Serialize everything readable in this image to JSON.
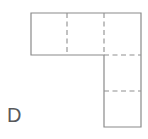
{
  "figure": {
    "label": "D",
    "shape_name": "l-shaped-net",
    "colors": {
      "outline": "#8a8a8a",
      "fold": "#8f8f8f",
      "fill": "#ffffff",
      "label": "#58595b",
      "background": "#ffffff"
    },
    "geometry": {
      "unit": 36,
      "outline_path": "M 31 13 L 141 13 L 141 127 L 104 127 L 104 55 L 31 55 Z",
      "fold_lines": [
        {
          "name": "fold-vertical-1",
          "x1": 67,
          "y1": 13,
          "x2": 67,
          "y2": 55
        },
        {
          "name": "fold-vertical-2",
          "x1": 104,
          "y1": 13,
          "x2": 104,
          "y2": 55
        },
        {
          "name": "fold-horizontal-1",
          "x1": 104,
          "y1": 55,
          "x2": 141,
          "y2": 55
        },
        {
          "name": "fold-horizontal-2",
          "x1": 104,
          "y1": 91,
          "x2": 141,
          "y2": 91
        }
      ]
    }
  }
}
